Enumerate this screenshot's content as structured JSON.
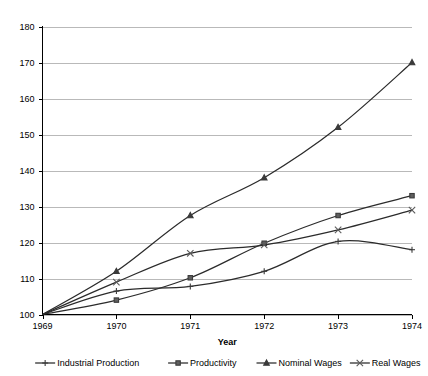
{
  "chart_data": {
    "type": "line",
    "title": "",
    "xlabel": "Year",
    "ylabel": "",
    "x": [
      1969,
      1970,
      1971,
      1972,
      1973,
      1974
    ],
    "xtick_labels": [
      "1969",
      "1970",
      "1971",
      "1972",
      "1973",
      "1974"
    ],
    "ytick_labels": [
      "100",
      "110",
      "120",
      "130",
      "140",
      "150",
      "160",
      "170",
      "180"
    ],
    "yticks": [
      100,
      110,
      120,
      130,
      140,
      150,
      160,
      170,
      180
    ],
    "ylim": [
      100,
      180
    ],
    "xlim": [
      1969,
      1974
    ],
    "grid": "horizontal",
    "legend_position": "bottom",
    "series": [
      {
        "name": "Industrial Production",
        "marker": "plus",
        "values": [
          100,
          106.5,
          107.8,
          112.0,
          120.3,
          118.0
        ]
      },
      {
        "name": "Productivity",
        "marker": "square",
        "values": [
          100,
          104.0,
          110.2,
          119.8,
          127.5,
          133.0
        ]
      },
      {
        "name": "Nominal Wages",
        "marker": "triangle",
        "values": [
          100,
          112.0,
          127.5,
          138.0,
          152.0,
          170.0
        ]
      },
      {
        "name": "Real Wages",
        "marker": "cross",
        "values": [
          100,
          109.0,
          117.0,
          119.3,
          123.5,
          129.0
        ]
      }
    ]
  },
  "legend": {
    "items": [
      {
        "label": "Industrial Production"
      },
      {
        "label": "Productivity"
      },
      {
        "label": "Nominal Wages"
      },
      {
        "label": "Real Wages"
      }
    ]
  },
  "colors": {
    "line": "#2b2b2b",
    "grid": "#b9b9b9",
    "axis": "#000000",
    "background": "#ffffff"
  }
}
